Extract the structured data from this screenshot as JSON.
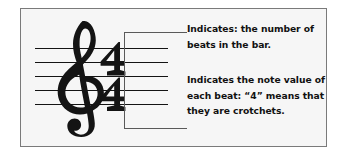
{
  "figure": {
    "kind": "music-notation-diagram",
    "background_color": "#f6f6f6",
    "border_color": "#7a7a7a",
    "ink_color": "#141414",
    "leader_color": "#5a5a5a"
  },
  "staff": {
    "name": "five-line-staff",
    "line_count": 5,
    "clef": "treble-clef",
    "clef_label": "Treble clef (G clef)"
  },
  "time_signature": {
    "label": "4/4",
    "top_number": "4",
    "bottom_number": "4"
  },
  "annotations": [
    {
      "id": "top-number-note",
      "target": "time-signature-top-number",
      "lines": [
        "Indicates: the number of",
        "beats in the bar."
      ]
    },
    {
      "id": "bottom-number-note",
      "target": "time-signature-bottom-number",
      "lines": [
        "Indicates the note value of",
        "each beat: “4” means that",
        "they are crotchets."
      ]
    }
  ]
}
